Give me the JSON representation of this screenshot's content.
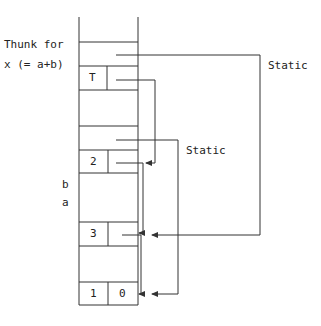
{
  "diagram": {
    "type": "runtime-stack",
    "labels": {
      "thunk_line1": "Thunk for",
      "thunk_line2": "x (= a+b)",
      "b": "b",
      "a": "a",
      "static_outer": "Static",
      "static_inner": "Static"
    },
    "cells": {
      "thunk_tag": "T",
      "b_value": "2",
      "a_value": "3",
      "bottom_left": "1",
      "bottom_right": "0"
    },
    "colors": {
      "line": "#333333",
      "background": "#ffffff"
    }
  }
}
